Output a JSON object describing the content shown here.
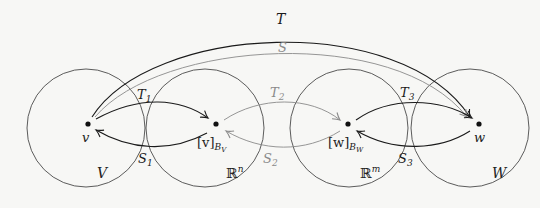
{
  "diagram": {
    "colors": {
      "background": "#f7f7f5",
      "black": "#1a1a1a",
      "gray": "#8a8a8a"
    },
    "spaces": [
      {
        "id": "V",
        "label": "V"
      },
      {
        "id": "Rn",
        "label": "ℝ",
        "sup": "n"
      },
      {
        "id": "Rm",
        "label": "ℝ",
        "sup": "m"
      },
      {
        "id": "W",
        "label": "W"
      }
    ],
    "points": [
      {
        "id": "v",
        "label": "v"
      },
      {
        "id": "vB",
        "label": "[v]",
        "sub": "B",
        "subsub": "V"
      },
      {
        "id": "wB",
        "label": "[w]",
        "sub": "B",
        "subsub": "W"
      },
      {
        "id": "w",
        "label": "w"
      }
    ],
    "maps": {
      "T": "T",
      "S": "S",
      "T1": {
        "base": "T",
        "sub": "1"
      },
      "S1": {
        "base": "S",
        "sub": "1"
      },
      "T2": {
        "base": "T",
        "sub": "2"
      },
      "S2": {
        "base": "S",
        "sub": "2"
      },
      "T3": {
        "base": "T",
        "sub": "3"
      },
      "S3": {
        "base": "S",
        "sub": "3"
      }
    }
  }
}
